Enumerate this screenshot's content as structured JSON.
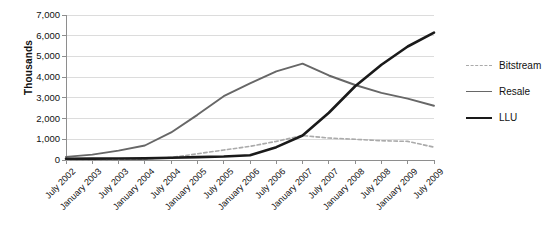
{
  "chart_data": {
    "type": "line",
    "title": "",
    "xlabel": "",
    "ylabel": "Thousands",
    "ylim": [
      0,
      7000
    ],
    "ytick_step": 1000,
    "grid": true,
    "legend_position": "right",
    "categories": [
      "July 2002",
      "January 2003",
      "July 2003",
      "January 2004",
      "July 2004",
      "January 2005",
      "July 2005",
      "January 2006",
      "July 2006",
      "January 2007",
      "July 2007",
      "January 2008",
      "July 2008",
      "January 2009",
      "July 2009"
    ],
    "ytick_labels": [
      "7,000",
      "6,000",
      "5,000",
      "4,000",
      "3,000",
      "2,000",
      "1,000",
      "0"
    ],
    "ytick_values": [
      7000,
      6000,
      5000,
      4000,
      3000,
      2000,
      1000,
      0
    ],
    "series": [
      {
        "name": "Bitstream",
        "color": "#aaaaaa",
        "style": "dashed",
        "width": 1.6,
        "values": [
          20,
          25,
          35,
          60,
          120,
          300,
          480,
          660,
          900,
          1180,
          1060,
          1000,
          930,
          900,
          620
        ]
      },
      {
        "name": "Resale",
        "color": "#676767",
        "style": "solid",
        "width": 1.9,
        "values": [
          150,
          260,
          450,
          700,
          1330,
          2180,
          3080,
          3700,
          4280,
          4650,
          4080,
          3620,
          3240,
          2960,
          2620
        ]
      },
      {
        "name": "LLU",
        "color": "#1a1a1a",
        "style": "solid",
        "width": 2.6,
        "values": [
          60,
          65,
          70,
          80,
          110,
          140,
          170,
          230,
          620,
          1180,
          2280,
          3560,
          4600,
          5480,
          6150
        ]
      }
    ]
  },
  "legend": {
    "items": [
      {
        "label": "Bitstream"
      },
      {
        "label": "Resale"
      },
      {
        "label": "LLU"
      }
    ]
  },
  "axes": {
    "y_title": "Thousands"
  }
}
